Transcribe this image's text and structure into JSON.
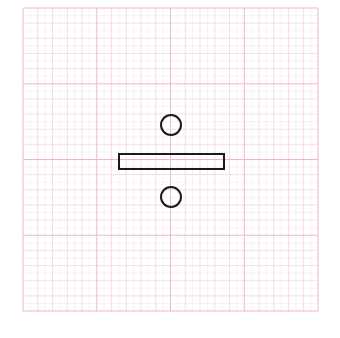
{
  "diagram": {
    "symbol": "division-sign",
    "grid": {
      "x": 23,
      "y": 8,
      "width": 295,
      "height": 303,
      "major_divisions": 4,
      "minor_per_major": 5,
      "fine_per_minor": 2,
      "major_color": "#f0b8c4",
      "minor_color": "#f6d4dc",
      "fine_color": "#f2eaf0"
    },
    "shapes": {
      "top_dot": {
        "cx": 171,
        "cy": 125,
        "r": 10
      },
      "bar": {
        "x": 119,
        "y": 154,
        "width": 105,
        "height": 15
      },
      "bottom_dot": {
        "cx": 171,
        "cy": 197,
        "r": 10
      },
      "stroke_color": "#1a1a1a",
      "stroke_width": 2
    }
  }
}
